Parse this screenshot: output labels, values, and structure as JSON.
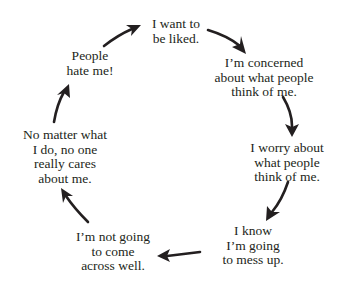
{
  "diagram": {
    "type": "cycle",
    "background_color": "#ffffff",
    "text_color": "#231f20",
    "arrow_color": "#231f20",
    "nodes": [
      {
        "id": "want-liked",
        "lines": [
          "I want to",
          "be liked."
        ]
      },
      {
        "id": "concerned",
        "lines": [
          "I’m concerned",
          "about what people",
          "think of me."
        ]
      },
      {
        "id": "worry",
        "lines": [
          "I worry about",
          "what people",
          "think of me."
        ]
      },
      {
        "id": "mess-up",
        "lines": [
          "I know",
          "I’m going",
          "to mess up."
        ]
      },
      {
        "id": "not-come-across",
        "lines": [
          "I’m not going",
          "to come",
          "across well."
        ]
      },
      {
        "id": "no-one-cares",
        "lines": [
          "No matter what",
          "I do, no one",
          "really cares",
          "about me."
        ]
      },
      {
        "id": "hate-me",
        "lines": [
          "People",
          "hate me!"
        ]
      }
    ],
    "edges": [
      {
        "from": "want-liked",
        "to": "concerned"
      },
      {
        "from": "concerned",
        "to": "worry"
      },
      {
        "from": "worry",
        "to": "mess-up"
      },
      {
        "from": "mess-up",
        "to": "not-come-across"
      },
      {
        "from": "not-come-across",
        "to": "no-one-cares"
      },
      {
        "from": "no-one-cares",
        "to": "hate-me"
      },
      {
        "from": "hate-me",
        "to": "want-liked"
      }
    ]
  }
}
